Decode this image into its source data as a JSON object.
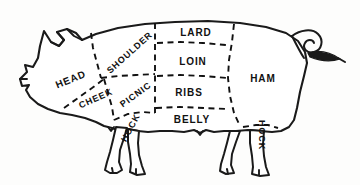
{
  "diagram": {
    "style": "line-drawing-dashed-cut-lines",
    "colors": {
      "background": "#fdfdfc",
      "outline": "#1a1a1a",
      "cut_line": "#111111",
      "label_text": "#111111",
      "fill": "#ffffff"
    },
    "cuts": [
      {
        "id": "head",
        "label": "HEAD",
        "x": 71,
        "y": 80,
        "rotation": -22,
        "font_size": 10
      },
      {
        "id": "cheek",
        "label": "CHEEK",
        "x": 96,
        "y": 99,
        "rotation": -24,
        "font_size": 9
      },
      {
        "id": "shoulder",
        "label": "SHOULDER",
        "x": 130,
        "y": 53,
        "rotation": -42,
        "font_size": 9
      },
      {
        "id": "picnic",
        "label": "PICNIC",
        "x": 136,
        "y": 95,
        "rotation": -36,
        "font_size": 9
      },
      {
        "id": "hock-front",
        "label": "HOCK",
        "x": 131,
        "y": 128,
        "rotation": -62,
        "font_size": 9
      },
      {
        "id": "lard",
        "label": "LARD",
        "x": 196,
        "y": 33,
        "rotation": 0,
        "font_size": 10
      },
      {
        "id": "loin",
        "label": "LOIN",
        "x": 193,
        "y": 62,
        "rotation": 0,
        "font_size": 10
      },
      {
        "id": "ribs",
        "label": "RIBS",
        "x": 189,
        "y": 93,
        "rotation": 0,
        "font_size": 10
      },
      {
        "id": "belly",
        "label": "BELLY",
        "x": 192,
        "y": 120,
        "rotation": 0,
        "font_size": 10
      },
      {
        "id": "ham",
        "label": "HAM",
        "x": 263,
        "y": 79,
        "rotation": 0,
        "font_size": 10
      },
      {
        "id": "hock-rear",
        "label": "HOCK",
        "x": 261,
        "y": 135,
        "rotation": 90,
        "font_size": 9
      }
    ]
  }
}
